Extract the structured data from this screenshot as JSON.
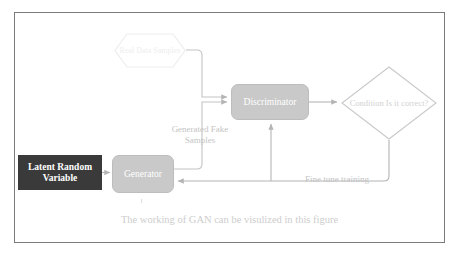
{
  "figure": {
    "caption": "The working of GAN can be visulized in this figure",
    "border_color": "#7b7b7b",
    "background": "#ffffff"
  },
  "nodes": {
    "latent": {
      "label": "Latent Random Variable",
      "shape": "rectangle",
      "fill": "#3a3a3a",
      "text_color": "#ffffff"
    },
    "generator": {
      "label": "Generator",
      "shape": "rounded-rectangle",
      "fill": "#c9c9c9",
      "text_color": "#ffffff"
    },
    "discriminator": {
      "label": "Discriminator",
      "shape": "rounded-rectangle",
      "fill": "#c9c9c9",
      "text_color": "#ffffff"
    },
    "real_data": {
      "label": "Real Data\nSamples",
      "shape": "hexagon",
      "fill": "#ffffff",
      "stroke": "#ececec",
      "text_color": "#eeeeee"
    },
    "condition": {
      "label": "Condition\nIs it correct?",
      "shape": "diamond",
      "fill": "#ffffff",
      "stroke": "#c9c9c9",
      "text_color": "#d2d2d2"
    }
  },
  "edge_labels": {
    "generated_fake_samples": "Generated Fake\nSamples",
    "fine_tune_training": "Fine tune training"
  },
  "edges": [
    {
      "from": "latent",
      "to": "generator",
      "name": "latent-to-generator"
    },
    {
      "from": "real_data",
      "to": "discriminator",
      "name": "real-data-to-discriminator"
    },
    {
      "from": "generator",
      "to": "discriminator",
      "name": "generator-to-discriminator",
      "label": "Generated Fake Samples"
    },
    {
      "from": "discriminator",
      "to": "condition",
      "name": "discriminator-to-condition"
    },
    {
      "from": "condition",
      "to": "generator",
      "name": "condition-to-generator",
      "label": "Fine tune training"
    },
    {
      "from": "feedback",
      "to": "discriminator",
      "name": "feedback-to-discriminator"
    }
  ],
  "colors": {
    "wire": "#bdbdbd",
    "node_gray": "#c9c9c9",
    "node_dark": "#3a3a3a",
    "faint_text": "#c4c4c4"
  }
}
